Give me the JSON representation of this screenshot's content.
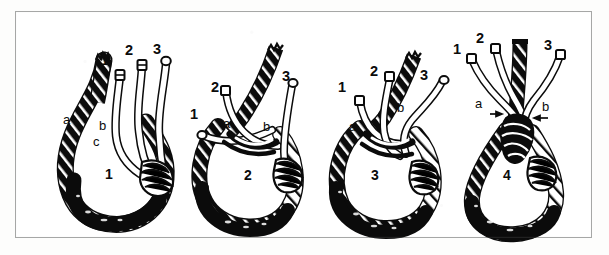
{
  "figure": {
    "kind": "line-drawing-diagram",
    "panel_count": 4,
    "border_color": "#a6a8a6",
    "ink_color": "#0b0b0b",
    "paper_color": "#ffffff"
  },
  "panels": [
    {
      "id": "panel-1",
      "figure_number": "1",
      "strand_labels": [
        {
          "text": "1",
          "x": 100,
          "y": 52
        },
        {
          "text": "2",
          "x": 124,
          "y": 42
        },
        {
          "text": "3",
          "x": 152,
          "y": 41
        }
      ],
      "part_labels": [
        {
          "text": "a",
          "x": 62,
          "y": 112
        },
        {
          "text": "b",
          "x": 98,
          "y": 118
        },
        {
          "text": "c",
          "x": 92,
          "y": 134
        }
      ],
      "figure_number_pos": {
        "x": 104,
        "y": 166
      }
    },
    {
      "id": "panel-2",
      "figure_number": "2",
      "strand_labels": [
        {
          "text": "1",
          "x": 189,
          "y": 106
        },
        {
          "text": "2",
          "x": 210,
          "y": 79
        },
        {
          "text": "3",
          "x": 281,
          "y": 68
        }
      ],
      "part_labels": [
        {
          "text": "a",
          "x": 222,
          "y": 116
        },
        {
          "text": "b",
          "x": 262,
          "y": 119
        }
      ],
      "figure_number_pos": {
        "x": 243,
        "y": 167
      }
    },
    {
      "id": "panel-3",
      "figure_number": "3",
      "strand_labels": [
        {
          "text": "1",
          "x": 337,
          "y": 79
        },
        {
          "text": "2",
          "x": 369,
          "y": 63
        },
        {
          "text": "3",
          "x": 419,
          "y": 67
        }
      ],
      "part_labels": [
        {
          "text": "a",
          "x": 348,
          "y": 119
        },
        {
          "text": "b",
          "x": 396,
          "y": 100
        }
      ],
      "figure_number_pos": {
        "x": 370,
        "y": 167
      }
    },
    {
      "id": "panel-4",
      "figure_number": "4",
      "strand_labels": [
        {
          "text": "1",
          "x": 452,
          "y": 41
        },
        {
          "text": "2",
          "x": 475,
          "y": 30
        },
        {
          "text": "3",
          "x": 543,
          "y": 37
        }
      ],
      "part_labels": [
        {
          "text": "a",
          "x": 474,
          "y": 96,
          "leader": "right"
        },
        {
          "text": "b",
          "x": 541,
          "y": 99,
          "leader": "left"
        }
      ],
      "figure_number_pos": {
        "x": 502,
        "y": 167
      }
    }
  ]
}
